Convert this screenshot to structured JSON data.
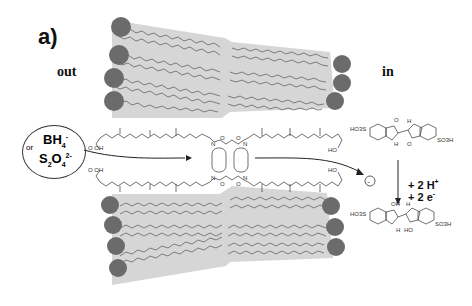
{
  "figure": {
    "panel_label": "a)",
    "side_labels": {
      "outside": "out",
      "inside": "in"
    },
    "reductant": {
      "species_1": "BH",
      "species_1_sub": "4",
      "species_1_sup": "-",
      "connector": "or",
      "species_2": "S",
      "species_2_sub_1": "2",
      "species_2_mid": "O",
      "species_2_sub_2": "4",
      "species_2_sup": "2-"
    },
    "charge_symbol": "-",
    "reaction": {
      "line_1": "+ 2 H",
      "line_1_sup": "+",
      "line_2": "+ 2 e",
      "line_2_sup": "-"
    },
    "oxidized_dye_labels": {
      "left_group": "HO3S",
      "right_group": "SO3H",
      "carbonyl_top": "O",
      "carbonyl_bottom": "O",
      "nh_top": "H",
      "nh_bottom": "H"
    },
    "reduced_dye_labels": {
      "left_group": "HO3S",
      "right_group": "SO3H",
      "hydroxyl_top": "OH",
      "hydroxyl_bottom": "HO",
      "nh_top": "H",
      "nh_bottom": "H"
    },
    "channel_labels": {
      "acid_left_top": "O   OH",
      "acid_left_bottom": "O   OH",
      "acid_right_top": "HO",
      "acid_right_bottom": "HO",
      "amide_N": "N",
      "amide_O": "O",
      "amide_H": "H"
    },
    "colors": {
      "lipid_head": "#6b6b6b",
      "lipid_tail_fill": "#d4d4d4",
      "tail_line": "#555555",
      "text": "#111111"
    }
  }
}
